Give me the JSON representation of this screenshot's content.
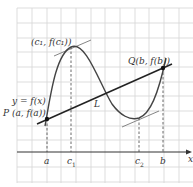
{
  "labels": {
    "max_point": "(c₁, f(c₁))",
    "q_point": "Q(b, f(b))",
    "function": "y = f(x)",
    "p_point": "P (a, f(a))",
    "secant": "L",
    "x_axis": "x",
    "tick_a": "a",
    "tick_c1": "c",
    "tick_c1_sub": "1",
    "tick_c2": "c",
    "tick_c2_sub": "2",
    "tick_b": "b"
  },
  "colors": {
    "grid": "#cfcfcf",
    "curve": "#444444",
    "line": "#222222",
    "tangent": "#777777",
    "axis": "#333333"
  }
}
